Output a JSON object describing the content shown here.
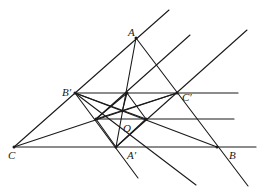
{
  "diagram": {
    "type": "geometry",
    "points": {
      "A": {
        "label": "A",
        "x": 136,
        "y": 38
      },
      "B_prime": {
        "label": "B′",
        "x": 75,
        "y": 93
      },
      "C_prime": {
        "label": "C′",
        "x": 177,
        "y": 93
      },
      "C": {
        "label": "C",
        "x": 14,
        "y": 147
      },
      "A_prime": {
        "label": "A′",
        "x": 116,
        "y": 147
      },
      "B": {
        "label": "B",
        "x": 217,
        "y": 147
      },
      "O": {
        "label": "O",
        "x": 122,
        "y": 112
      }
    },
    "labels": {
      "A": "A",
      "B_prime": "B′",
      "C_prime": "C′",
      "C": "C",
      "A_prime": "A′",
      "B": "B",
      "O": "O"
    },
    "colors": {
      "stroke": "#1a1a1a",
      "background": "#ffffff"
    }
  }
}
